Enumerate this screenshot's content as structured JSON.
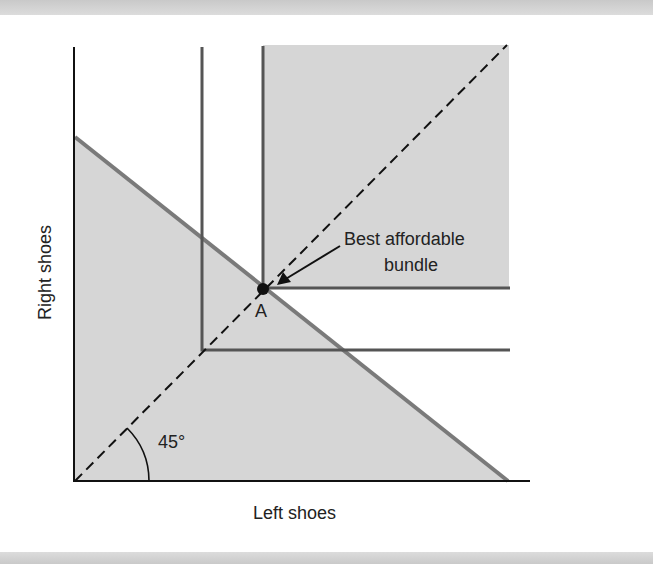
{
  "diagram": {
    "x_axis_label": "Left shoes",
    "y_axis_label": "Right shoes",
    "angle_label": "45°",
    "point_label": "A",
    "annotation_line1": "Best affordable",
    "annotation_line2": "bundle",
    "colors": {
      "shaded_region": "#d6d6d6",
      "budget_line": "#7a7a7a",
      "indifference_curves": "#555555",
      "axes": "#111111"
    }
  }
}
